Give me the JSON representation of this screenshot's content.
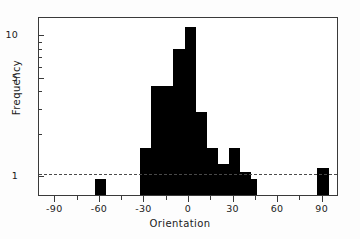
{
  "chart_data": {
    "type": "bar",
    "title": "",
    "xlabel": "Orientation",
    "ylabel": "Frequency",
    "xlim": [
      -101,
      101
    ],
    "ylim": [
      0.72,
      13.5
    ],
    "yscale": "log",
    "grid": false,
    "legend": null,
    "bin_width": 7.5,
    "annotations": [
      {
        "name": "reference-line",
        "type": "hline",
        "y": 1,
        "style": "dashed"
      }
    ],
    "xticks": [
      -90,
      -60,
      -30,
      0,
      30,
      60,
      90
    ],
    "xtick_labels": [
      "-90",
      "-60",
      "-30",
      "0",
      "30",
      "60",
      "90"
    ],
    "xminor_ticks": [
      -75,
      -45,
      -15,
      15,
      45,
      75
    ],
    "yticks": [
      1,
      5,
      10
    ],
    "ytick_labels": [
      "1",
      "5",
      "10"
    ],
    "yminor_ticks": [
      2,
      3,
      4,
      6,
      7,
      8,
      9
    ],
    "bars": [
      {
        "x_left": -63.5,
        "x_right": -56.0,
        "center": -59.8,
        "value": 0.93
      },
      {
        "x_left": -33.0,
        "x_right": -25.5,
        "center": -29.3,
        "value": 1.55
      },
      {
        "x_left": -25.5,
        "x_right": -18.0,
        "center": -21.8,
        "value": 4.3
      },
      {
        "x_left": -18.0,
        "x_right": -10.5,
        "center": -14.3,
        "value": 4.3
      },
      {
        "x_left": -10.5,
        "x_right": -3.0,
        "center": -6.8,
        "value": 7.9
      },
      {
        "x_left": -3.0,
        "x_right": 4.5,
        "center": 0.8,
        "value": 11.3
      },
      {
        "x_left": 4.5,
        "x_right": 12.0,
        "center": 8.3,
        "value": 2.8
      },
      {
        "x_left": 12.0,
        "x_right": 19.5,
        "center": 15.8,
        "value": 1.55
      },
      {
        "x_left": 19.5,
        "x_right": 27.0,
        "center": 23.3,
        "value": 1.2
      },
      {
        "x_left": 27.0,
        "x_right": 34.5,
        "center": 30.8,
        "value": 1.55
      },
      {
        "x_left": 34.5,
        "x_right": 42.0,
        "center": 38.3,
        "value": 1.05
      },
      {
        "x_left": 42.0,
        "x_right": 45.5,
        "center": 43.8,
        "value": 0.93
      },
      {
        "x_left": 86.5,
        "x_right": 94.0,
        "center": 90.3,
        "value": 1.12
      }
    ],
    "colors": {
      "bar": "#000000",
      "axis": "#3a3a3a",
      "reference_line": "#4a4a4a",
      "background": "#ffffff"
    }
  }
}
